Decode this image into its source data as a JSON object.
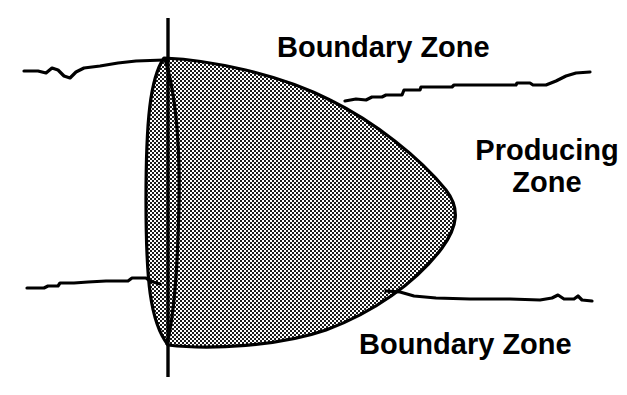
{
  "figure": {
    "background_color": "#ffffff",
    "line_color": "#000000",
    "fill_pattern": "checkerboard-dither-50-percent",
    "fill_tone": "#808080"
  },
  "labels": {
    "boundary_top": "Boundary Zone",
    "boundary_bottom": "Boundary Zone",
    "producing_line1": "Producing",
    "producing_line2": "Zone"
  },
  "elements": {
    "wellbore_label": "vertical-wellbore-line",
    "producing_zone_label": "shaded-producing-zone-lens",
    "upper_boundary_label": "upper-boundary-horizon-line",
    "lower_boundary_label": "lower-boundary-horizon-line",
    "inner_curve_label": "inner-lens-curve"
  }
}
